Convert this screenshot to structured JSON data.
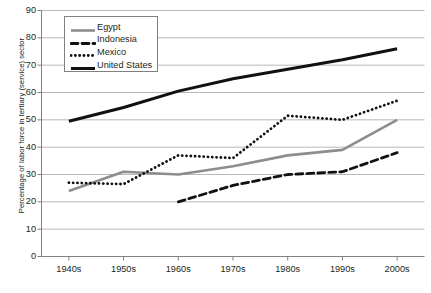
{
  "chart_data": {
    "type": "line",
    "title": "",
    "xlabel": "",
    "ylabel": "Percentage of labor force in tertiary (service) sector",
    "categories": [
      "1940s",
      "1950s",
      "1960s",
      "1970s",
      "1980s",
      "1990s",
      "2000s"
    ],
    "ylim": [
      0,
      90
    ],
    "ytick_step": 10,
    "yticks": [
      "90",
      "80",
      "70",
      "60",
      "50",
      "40",
      "30",
      "20",
      "10",
      "0"
    ],
    "grid": "horizontal",
    "legend_position": "top-left-inside",
    "series": [
      {
        "name": "Egypt",
        "style": "solid",
        "color": "#8d8d8d",
        "values": [
          24,
          31,
          30,
          33,
          37,
          39,
          50
        ]
      },
      {
        "name": "Indonesia",
        "style": "dashed",
        "color": "#111111",
        "values": [
          null,
          null,
          20,
          26,
          30,
          31,
          38
        ]
      },
      {
        "name": "Mexico",
        "style": "dotted",
        "color": "#111111",
        "values": [
          27,
          26.5,
          37,
          36,
          51.5,
          50,
          57
        ]
      },
      {
        "name": "United States",
        "style": "solid-thick",
        "color": "#111111",
        "values": [
          49.5,
          54.5,
          60.5,
          65,
          68.5,
          72,
          76
        ]
      }
    ]
  },
  "legend": {
    "items": [
      {
        "label": "Egypt"
      },
      {
        "label": "Indonesia"
      },
      {
        "label": "Mexico"
      },
      {
        "label": "United States"
      }
    ]
  },
  "caption": {
    "fragment": ""
  }
}
